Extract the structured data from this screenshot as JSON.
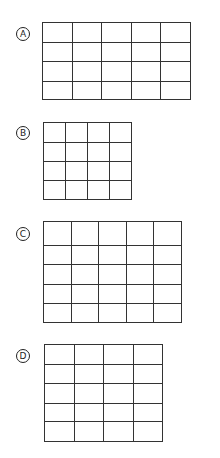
{
  "options": [
    {
      "label": "A",
      "grid": {
        "columns": 5,
        "rows": 4,
        "left": 42,
        "top": 22,
        "cell_width": 30,
        "row_heights": [
          20,
          20,
          20,
          19
        ]
      },
      "label_center": [
        23,
        34
      ]
    },
    {
      "label": "B",
      "grid": {
        "columns": 4,
        "rows": 4,
        "left": 43,
        "top": 122,
        "cell_width": 22.5,
        "row_heights": [
          20,
          20,
          19,
          20
        ]
      },
      "label_center": [
        23,
        133
      ]
    },
    {
      "label": "C",
      "grid": {
        "columns": 5,
        "rows": 5,
        "left": 43,
        "top": 221,
        "cell_width": 28,
        "row_heights": [
          24,
          20,
          20,
          20,
          19
        ]
      },
      "label_center": [
        23,
        234
      ]
    },
    {
      "label": "D",
      "grid": {
        "columns": 4,
        "rows": 5,
        "left": 44,
        "top": 344,
        "cell_width": 30,
        "row_heights": [
          20,
          20,
          20,
          19,
          20
        ]
      },
      "label_center": [
        23,
        356
      ]
    }
  ],
  "colors": {
    "line": "#333333",
    "background": "#ffffff"
  }
}
